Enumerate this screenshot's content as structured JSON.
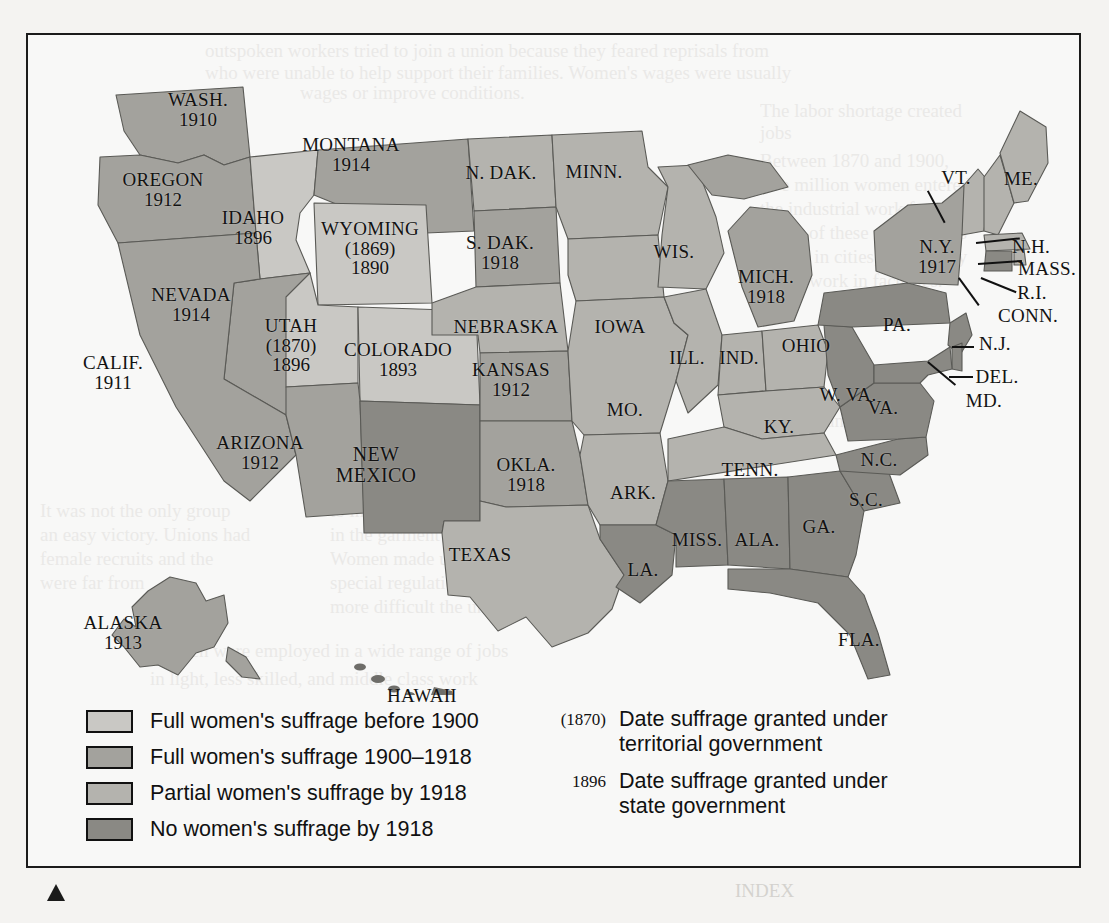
{
  "figure": {
    "kind": "thematic-map",
    "border_color": "#1b1b1b"
  },
  "palette": {
    "full_before_1900": "#c9c8c4",
    "full_1900_1918": "#a3a29d",
    "partial_by_1918": "#b4b3ae",
    "none_by_1918": "#8a8984",
    "water": "#fbfbf9",
    "outline": "#5a5a56",
    "text": "#121212"
  },
  "legend": {
    "items": [
      {
        "label": "Full women's suffrage before 1900",
        "color": "#c9c8c4",
        "key": "full_before_1900"
      },
      {
        "label": "Full women's suffrage 1900–1918",
        "color": "#a3a29d",
        "key": "full_1900_1918"
      },
      {
        "label": "Partial women's suffrage by 1918",
        "color": "#b4b3ae",
        "key": "partial_by_1918"
      },
      {
        "label": "No women's suffrage by 1918",
        "color": "#8a8984",
        "key": "none_by_1918"
      }
    ],
    "notes": [
      {
        "sample": "(1870)",
        "line1": "Date suffrage granted under",
        "line2": "territorial government"
      },
      {
        "sample": "1896",
        "line1": "Date suffrage granted under",
        "line2": "state government"
      }
    ]
  },
  "chart_data": {
    "type": "map",
    "categories": [
      "Full women's suffrage before 1900",
      "Full women's suffrage 1900–1918",
      "Partial women's suffrage by 1918",
      "No women's suffrage by 1918"
    ],
    "states": [
      {
        "abbr": "WASH.",
        "name": "Washington",
        "year": "1910",
        "category": "full_1900_1918",
        "x": 170,
        "y": 75
      },
      {
        "abbr": "OREGON",
        "name": "Oregon",
        "year": "1912",
        "category": "full_1900_1918",
        "x": 135,
        "y": 155
      },
      {
        "abbr": "IDAHO",
        "name": "Idaho",
        "year": "1896",
        "category": "full_before_1900",
        "x": 225,
        "y": 193
      },
      {
        "abbr": "MONTANA",
        "name": "Montana",
        "year": "1914",
        "category": "full_1900_1918",
        "x": 323,
        "y": 120
      },
      {
        "abbr": "WYOMING",
        "name": "Wyoming",
        "year": "1890",
        "territorial_year": "(1869)",
        "category": "full_before_1900",
        "x": 342,
        "y": 213
      },
      {
        "abbr": "NEVADA",
        "name": "Nevada",
        "year": "1914",
        "category": "full_1900_1918",
        "x": 163,
        "y": 270
      },
      {
        "abbr": "UTAH",
        "name": "Utah",
        "year": "1896",
        "territorial_year": "(1870)",
        "category": "full_before_1900",
        "x": 263,
        "y": 310
      },
      {
        "abbr": "COLORADO",
        "name": "Colorado",
        "year": "1893",
        "category": "full_before_1900",
        "x": 370,
        "y": 325
      },
      {
        "abbr": "CALIF.",
        "name": "California",
        "year": "1911",
        "category": "full_1900_1918",
        "x": 85,
        "y": 338
      },
      {
        "abbr": "ARIZONA",
        "name": "Arizona",
        "year": "1912",
        "category": "full_1900_1918",
        "x": 232,
        "y": 418
      },
      {
        "abbr": "NEW MEXICO",
        "name": "New Mexico",
        "year": "",
        "category": "none_by_1918",
        "x": 348,
        "y": 430
      },
      {
        "abbr": "N. DAK.",
        "name": "North Dakota",
        "year": "",
        "category": "partial_by_1918",
        "x": 473,
        "y": 138
      },
      {
        "abbr": "S. DAK.",
        "name": "South Dakota",
        "year": "1918",
        "category": "full_1900_1918",
        "x": 472,
        "y": 218
      },
      {
        "abbr": "NEBRASKA",
        "name": "Nebraska",
        "year": "",
        "category": "partial_by_1918",
        "x": 478,
        "y": 292
      },
      {
        "abbr": "KANSAS",
        "name": "Kansas",
        "year": "1912",
        "category": "full_1900_1918",
        "x": 483,
        "y": 345
      },
      {
        "abbr": "OKLA.",
        "name": "Oklahoma",
        "year": "1918",
        "category": "full_1900_1918",
        "x": 498,
        "y": 440
      },
      {
        "abbr": "TEXAS",
        "name": "Texas",
        "year": "",
        "category": "partial_by_1918",
        "x": 452,
        "y": 520
      },
      {
        "abbr": "MINN.",
        "name": "Minnesota",
        "year": "",
        "category": "partial_by_1918",
        "x": 566,
        "y": 137
      },
      {
        "abbr": "IOWA",
        "name": "Iowa",
        "year": "",
        "category": "partial_by_1918",
        "x": 592,
        "y": 292
      },
      {
        "abbr": "MO.",
        "name": "Missouri",
        "year": "",
        "category": "partial_by_1918",
        "x": 597,
        "y": 375
      },
      {
        "abbr": "ARK.",
        "name": "Arkansas",
        "year": "",
        "category": "partial_by_1918",
        "x": 605,
        "y": 458
      },
      {
        "abbr": "LA.",
        "name": "Louisiana",
        "year": "",
        "category": "none_by_1918",
        "x": 615,
        "y": 535
      },
      {
        "abbr": "WIS.",
        "name": "Wisconsin",
        "year": "",
        "category": "partial_by_1918",
        "x": 646,
        "y": 217
      },
      {
        "abbr": "ILL.",
        "name": "Illinois",
        "year": "",
        "category": "partial_by_1918",
        "x": 659,
        "y": 323
      },
      {
        "abbr": "IND.",
        "name": "Indiana",
        "year": "",
        "category": "partial_by_1918",
        "x": 711,
        "y": 323
      },
      {
        "abbr": "MICH.",
        "name": "Michigan",
        "year": "1918",
        "category": "full_1900_1918",
        "x": 738,
        "y": 252
      },
      {
        "abbr": "OHIO",
        "name": "Ohio",
        "year": "",
        "category": "partial_by_1918",
        "x": 778,
        "y": 311
      },
      {
        "abbr": "KY.",
        "name": "Kentucky",
        "year": "",
        "category": "partial_by_1918",
        "x": 751,
        "y": 392
      },
      {
        "abbr": "TENN.",
        "name": "Tennessee",
        "year": "",
        "category": "partial_by_1918",
        "x": 722,
        "y": 435
      },
      {
        "abbr": "MISS.",
        "name": "Mississippi",
        "year": "",
        "category": "none_by_1918",
        "x": 669,
        "y": 505
      },
      {
        "abbr": "ALA.",
        "name": "Alabama",
        "year": "",
        "category": "none_by_1918",
        "x": 729,
        "y": 505
      },
      {
        "abbr": "GA.",
        "name": "Georgia",
        "year": "",
        "category": "none_by_1918",
        "x": 791,
        "y": 492
      },
      {
        "abbr": "FLA.",
        "name": "Florida",
        "year": "",
        "category": "none_by_1918",
        "x": 831,
        "y": 605
      },
      {
        "abbr": "S.C.",
        "name": "South Carolina",
        "year": "",
        "category": "none_by_1918",
        "x": 838,
        "y": 465
      },
      {
        "abbr": "N.C.",
        "name": "North Carolina",
        "year": "",
        "category": "none_by_1918",
        "x": 851,
        "y": 425
      },
      {
        "abbr": "VA.",
        "name": "Virginia",
        "year": "",
        "category": "none_by_1918",
        "x": 855,
        "y": 373
      },
      {
        "abbr": "W. VA.",
        "name": "West Virginia",
        "year": "",
        "category": "none_by_1918",
        "x": 820,
        "y": 360
      },
      {
        "abbr": "PA.",
        "name": "Pennsylvania",
        "year": "",
        "category": "none_by_1918",
        "x": 869,
        "y": 290
      },
      {
        "abbr": "N.Y.",
        "name": "New York",
        "year": "1917",
        "category": "full_1900_1918",
        "x": 909,
        "y": 222
      },
      {
        "abbr": "VT.",
        "name": "Vermont",
        "year": "",
        "category": "partial_by_1918",
        "x": 928,
        "y": 143
      },
      {
        "abbr": "ME.",
        "name": "Maine",
        "year": "",
        "category": "partial_by_1918",
        "x": 993,
        "y": 144
      },
      {
        "abbr": "N.H.",
        "name": "New Hampshire",
        "year": "",
        "category": "partial_by_1918",
        "x": 1003,
        "y": 212
      },
      {
        "abbr": "MASS.",
        "name": "Massachusetts",
        "year": "",
        "category": "partial_by_1918",
        "x": 1019,
        "y": 234
      },
      {
        "abbr": "R.I.",
        "name": "Rhode Island",
        "year": "",
        "category": "partial_by_1918",
        "x": 1004,
        "y": 258
      },
      {
        "abbr": "CONN.",
        "name": "Connecticut",
        "year": "",
        "category": "none_by_1918",
        "x": 1000,
        "y": 281
      },
      {
        "abbr": "N.J.",
        "name": "New Jersey",
        "year": "",
        "category": "none_by_1918",
        "x": 967,
        "y": 309
      },
      {
        "abbr": "DEL.",
        "name": "Delaware",
        "year": "",
        "category": "none_by_1918",
        "x": 969,
        "y": 342
      },
      {
        "abbr": "MD.",
        "name": "Maryland",
        "year": "",
        "category": "none_by_1918",
        "x": 956,
        "y": 366
      },
      {
        "abbr": "ALASKA",
        "name": "Alaska",
        "year": "1913",
        "category": "full_1900_1918",
        "x": 95,
        "y": 598
      },
      {
        "abbr": "HAWAII",
        "name": "Hawaii",
        "year": "",
        "category": "none_by_1918",
        "x": 394,
        "y": 661
      }
    ]
  },
  "ghost_text": [
    {
      "t": "outspoken workers tried to join a union because they feared reprisals from",
      "x": 205,
      "y": 40
    },
    {
      "t": "who were unable to help support their families. Women's wages were usually",
      "x": 205,
      "y": 62
    },
    {
      "t": "wages or improve conditions.",
      "x": 300,
      "y": 82
    },
    {
      "t": "The labor shortage created",
      "x": 760,
      "y": 100
    },
    {
      "t": "jobs",
      "x": 760,
      "y": 122
    },
    {
      "t": "Between 1870 and 1900,",
      "x": 760,
      "y": 150
    },
    {
      "t": "five million women entered",
      "x": 760,
      "y": 174
    },
    {
      "t": "the industrial work force.",
      "x": 760,
      "y": 198
    },
    {
      "t": "Many of these new arrivals",
      "x": 760,
      "y": 222
    },
    {
      "t": "settled in cities, where they",
      "x": 760,
      "y": 246
    },
    {
      "t": "found work in factories.",
      "x": 760,
      "y": 270
    },
    {
      "t": "workers and the labor",
      "x": 760,
      "y": 410
    },
    {
      "t": "It was not the only group",
      "x": 40,
      "y": 500
    },
    {
      "t": "an easy victory. Unions had",
      "x": 40,
      "y": 524
    },
    {
      "t": "female recruits and the",
      "x": 40,
      "y": 548
    },
    {
      "t": "were far from",
      "x": 40,
      "y": 572
    },
    {
      "t": "to improve the working conditions",
      "x": 330,
      "y": 500
    },
    {
      "t": "in the garment trades. Their possibility",
      "x": 330,
      "y": 524
    },
    {
      "t": "Women made up a very small",
      "x": 330,
      "y": 548
    },
    {
      "t": "special regulations",
      "x": 330,
      "y": 572
    },
    {
      "t": "more difficult the union",
      "x": 330,
      "y": 596
    },
    {
      "t": "Women were employed in a wide range of jobs",
      "x": 150,
      "y": 640
    },
    {
      "t": "in light, less skilled, and middle class work",
      "x": 150,
      "y": 668
    },
    {
      "t": "INDEX",
      "x": 735,
      "y": 880
    }
  ]
}
